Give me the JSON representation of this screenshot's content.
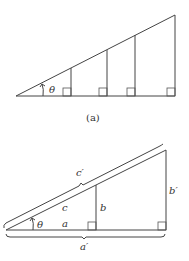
{
  "figure_a": {
    "caption": "(a)",
    "angle_label": "θ",
    "description": "Right triangle with several nested similar right triangles sharing the angle θ; vertical segments drop from the hypotenuse to the base, each marked with a right-angle square."
  },
  "figure_b": {
    "angle_label": "θ",
    "small_triangle": {
      "hypotenuse": "c",
      "opposite": "b",
      "adjacent": "a"
    },
    "large_triangle": {
      "hypotenuse": "c′",
      "opposite": "b′",
      "adjacent": "a′"
    },
    "description": "Two similar right triangles sharing angle θ; braces indicate the larger triangle's hypotenuse c′ and base a′."
  },
  "colors": {
    "line": "#444444",
    "text": "#333333",
    "background": "#ffffff"
  }
}
